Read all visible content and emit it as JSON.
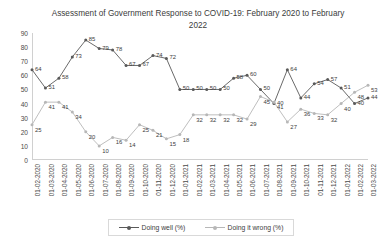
{
  "chart_data": {
    "type": "line",
    "title": "Assessment of Government Response to COVID-19: February 2020 to February 2022",
    "xlabel": "",
    "ylabel": "",
    "ylim": [
      0,
      90
    ],
    "ytickstep": 10,
    "yticks": [
      "0",
      "10",
      "20",
      "30",
      "40",
      "50",
      "60",
      "70",
      "80",
      "90"
    ],
    "grid": false,
    "legend_position": "bottom",
    "categories": [
      "01-02-2020",
      "01-03-2020",
      "01-04-2020",
      "01-05-2020",
      "01-06-2020",
      "01-07-2020",
      "01-08-2020",
      "01-09-2020",
      "01-10-2020",
      "01-11-2020",
      "01-12-2020",
      "01-01-2021",
      "01-02-2021",
      "01-03-2021",
      "01-04-2021",
      "01-05-2021",
      "01-06-2021",
      "01-07-2021",
      "01-08-2021",
      "01-09-2021",
      "01-10-2021",
      "01-11-2021",
      "01-12-2021",
      "01-01-2022",
      "01-02-2022",
      "01-03-2022"
    ],
    "series": [
      {
        "name": "Doing well (%)",
        "color": "#595959",
        "values": [
          64,
          51,
          58,
          73,
          85,
          79,
          78,
          67,
          67,
          74,
          72,
          50,
          50,
          50,
          50,
          58,
          60,
          50,
          40,
          64,
          44,
          54,
          57,
          51,
          40,
          44
        ]
      },
      {
        "name": "Doing it wrong (%)",
        "color": "#b7b7b7",
        "values": [
          25,
          41,
          41,
          34,
          20,
          10,
          16,
          14,
          25,
          21,
          15,
          18,
          32,
          32,
          32,
          32,
          29,
          45,
          41,
          27,
          36,
          33,
          32,
          40,
          48,
          53
        ]
      }
    ]
  },
  "legend": {
    "items": [
      {
        "label": "Doing well (%)",
        "color": "#595959"
      },
      {
        "label": "Doing it wrong (%)",
        "color": "#b7b7b7"
      }
    ]
  }
}
